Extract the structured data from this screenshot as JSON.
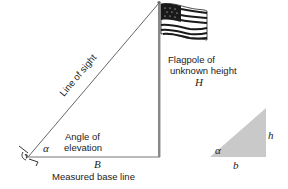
{
  "diagram": {
    "labels": {
      "line_of_sight": "Line of sight",
      "flagpole_line1": "Flagpole of",
      "flagpole_line2": "unknown height",
      "flagpole_symbol": "H",
      "angle_line1": "Angle of",
      "angle_line2": "elevation",
      "angle_symbol": "α",
      "base_symbol": "B",
      "base_label": "Measured base line",
      "triangle_height_symbol": "h",
      "triangle_base_symbol": "b",
      "triangle_angle_symbol": "α"
    },
    "colors": {
      "line": "#555555",
      "triangle_fill": "#c9c9c9",
      "flag": "#1a1a1a",
      "text": "#222222"
    },
    "icons": [
      "eye-icon",
      "flag-icon"
    ]
  }
}
